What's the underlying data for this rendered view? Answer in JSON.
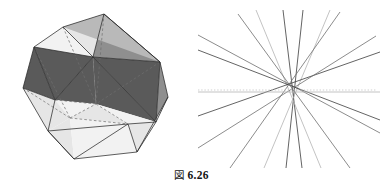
{
  "figure": {
    "caption_mark": "図",
    "caption_number": "6.26",
    "caption_full": "図 6.26",
    "background_color": "#ffffff"
  },
  "palette": {
    "edge_dark": "#2a2a2a",
    "edge_hidden": "#6b6b6b",
    "face_dark": "#5a5a5a",
    "face_mid": "#8f8f8f",
    "face_light_mid": "#b9b9b9",
    "face_light": "#e6e6e6",
    "face_lightest": "#f2f2f2",
    "line_dark": "#3c3c3c",
    "line_mid": "#6e6e6e",
    "line_light": "#b4b4b4",
    "line_dotted": "#c9c9c9"
  },
  "panel_left": {
    "name": "icosahedron-illustration",
    "description": "shaded icosahedron with hidden edges dashed",
    "vertices": {
      "v_top": [
        104,
        14
      ],
      "v_upper_left": [
        34,
        47
      ],
      "v_upper_mid_left": [
        63,
        27
      ],
      "v_upper_right": [
        160,
        62
      ],
      "v_right": [
        168,
        97
      ],
      "v_mid_left": [
        23,
        88
      ],
      "v_center_left": [
        55,
        100
      ],
      "v_center": [
        93,
        57
      ],
      "v_center_low": [
        128,
        124
      ],
      "v_bottom_left": [
        48,
        131
      ],
      "v_bottom": [
        74,
        159
      ],
      "v_bottom_right": [
        137,
        152
      ],
      "v_low_right": [
        156,
        122
      ],
      "v_inner_a": [
        96,
        104
      ],
      "v_inner_b": [
        70,
        118
      ]
    },
    "faces": [
      {
        "id": "f1",
        "tone": "face_light"
      },
      {
        "id": "f2",
        "tone": "face_mid"
      },
      {
        "id": "f3",
        "tone": "face_dark"
      },
      {
        "id": "f4",
        "tone": "face_light_mid"
      },
      {
        "id": "f5",
        "tone": "face_lightest"
      }
    ]
  },
  "panel_right": {
    "name": "line-arrangement-diagram",
    "description": "pencil of straight lines intersecting near a common center with a dotted horizontal axis",
    "center": [
      103,
      92
    ],
    "dotted_axis": {
      "y": 90,
      "x_start": 8,
      "x_end": 186,
      "tone": "line_dotted"
    },
    "lines": [
      {
        "x1": 93,
        "y1": 10,
        "x2": 112,
        "y2": 168,
        "tone": "line_dark"
      },
      {
        "x1": 113,
        "y1": 10,
        "x2": 96,
        "y2": 168,
        "tone": "line_dark"
      },
      {
        "x1": 66,
        "y1": 10,
        "x2": 131,
        "y2": 168,
        "tone": "line_light"
      },
      {
        "x1": 140,
        "y1": 10,
        "x2": 74,
        "y2": 168,
        "tone": "line_light"
      },
      {
        "x1": 8,
        "y1": 35,
        "x2": 190,
        "y2": 133,
        "tone": "line_mid"
      },
      {
        "x1": 8,
        "y1": 50,
        "x2": 190,
        "y2": 120,
        "tone": "line_dark"
      },
      {
        "x1": 8,
        "y1": 116,
        "x2": 190,
        "y2": 52,
        "tone": "line_dark"
      },
      {
        "x1": 8,
        "y1": 148,
        "x2": 186,
        "y2": 36,
        "tone": "line_mid"
      },
      {
        "x1": 40,
        "y1": 168,
        "x2": 150,
        "y2": 12,
        "tone": "line_mid"
      },
      {
        "x1": 160,
        "y1": 168,
        "x2": 48,
        "y2": 14,
        "tone": "line_mid"
      },
      {
        "x1": 8,
        "y1": 92,
        "x2": 190,
        "y2": 92,
        "tone": "line_light"
      }
    ]
  }
}
